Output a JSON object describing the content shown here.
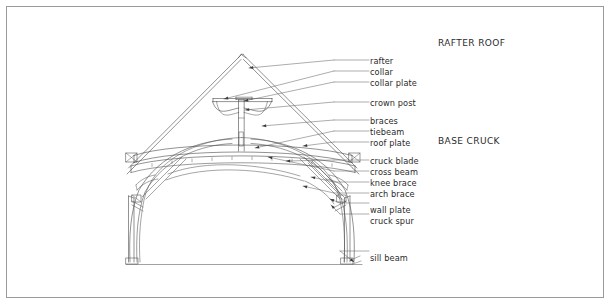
{
  "figure": {
    "type": "architectural-line-drawing",
    "background_color": "#ffffff",
    "line_color": "#4a4a4a",
    "text_color": "#2b2b2b",
    "border_color": "#9a9a9a"
  },
  "headers": [
    {
      "text": "RAFTER ROOF",
      "x": 438,
      "y": 39
    },
    {
      "text": "BASE CRUCK",
      "x": 438,
      "y": 137
    }
  ],
  "labels": [
    {
      "id": "rafter",
      "text": "rafter",
      "x": 370,
      "y": 57,
      "leader_from_x": 334,
      "leader_from_y": 60,
      "target_x": 249,
      "target_y": 68
    },
    {
      "id": "collar",
      "text": "collar",
      "x": 370,
      "y": 68,
      "leader_from_x": 334,
      "leader_from_y": 71,
      "target_x": 224,
      "target_y": 99
    },
    {
      "id": "collar-plate",
      "text": "collar plate",
      "x": 370,
      "y": 79,
      "leader_from_x": 334,
      "leader_from_y": 82,
      "target_x": 244,
      "target_y": 101
    },
    {
      "id": "crown-post",
      "text": "crown post",
      "x": 370,
      "y": 99,
      "leader_from_x": 334,
      "leader_from_y": 102,
      "target_x": 245,
      "target_y": 110
    },
    {
      "id": "braces",
      "text": "braces",
      "x": 370,
      "y": 117,
      "leader_from_x": 334,
      "leader_from_y": 120,
      "target_x": 262,
      "target_y": 126
    },
    {
      "id": "tiebeam",
      "text": "tiebeam",
      "x": 370,
      "y": 128,
      "leader_from_x": 334,
      "leader_from_y": 131,
      "target_x": 255,
      "target_y": 148
    },
    {
      "id": "roof-plate",
      "text": "roof plate",
      "x": 370,
      "y": 139,
      "leader_from_x": 334,
      "leader_from_y": 142,
      "target_x": 303,
      "target_y": 146
    },
    {
      "id": "cruck-blade",
      "text": "cruck blade",
      "x": 370,
      "y": 157,
      "leader_from_x": 334,
      "leader_from_y": 160,
      "target_x": 286,
      "target_y": 161
    },
    {
      "id": "cross-beam",
      "text": "cross beam",
      "x": 370,
      "y": 168,
      "leader_from_x": 334,
      "leader_from_y": 171,
      "target_x": 268,
      "target_y": 157
    },
    {
      "id": "knee-brace",
      "text": "knee brace",
      "x": 370,
      "y": 179,
      "leader_from_x": 334,
      "leader_from_y": 182,
      "target_x": 311,
      "target_y": 177
    },
    {
      "id": "arch-brace",
      "text": "arch brace",
      "x": 370,
      "y": 190,
      "leader_from_x": 334,
      "leader_from_y": 193,
      "target_x": 303,
      "target_y": 186
    },
    {
      "id": "wall-plate",
      "text": "wall plate",
      "x": 370,
      "y": 206,
      "leader_from_x": 340,
      "leader_from_y": 203,
      "target_x": 330,
      "target_y": 199
    },
    {
      "id": "cruck-spur",
      "text": "cruck spur",
      "x": 370,
      "y": 217,
      "leader_from_x": 340,
      "leader_from_y": 214,
      "target_x": 331,
      "target_y": 205
    },
    {
      "id": "sill-beam",
      "text": "sill beam",
      "x": 370,
      "y": 254,
      "leader_from_x": 340,
      "leader_from_y": 251,
      "target_x": 354,
      "target_y": 262
    }
  ],
  "geometry": {
    "apex": {
      "x": 241,
      "y": 55
    },
    "ground_line": {
      "x1": 126,
      "y1": 264,
      "x2": 362,
      "y2": 264
    },
    "collar_plate_y": 101,
    "cross_beam_y": 152,
    "left_post_x": 137,
    "right_post_x": 348
  }
}
